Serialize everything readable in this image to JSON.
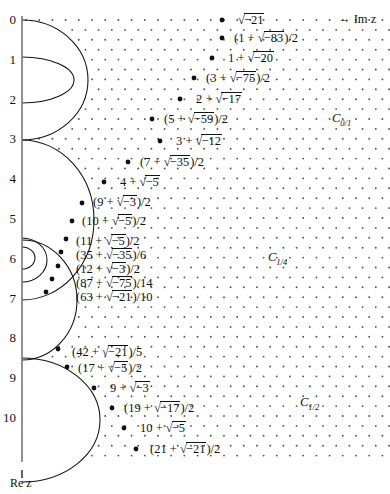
{
  "figure": {
    "title_axis_real": "Re z",
    "axis_imag_label": "→ Im z",
    "real_axis_ticks": [
      "0",
      "1",
      "2",
      "3",
      "4",
      "5",
      "6",
      "7",
      "8",
      "9",
      "10"
    ],
    "colors": {
      "ink": "#111111",
      "lattice_dot": "#555555",
      "axis": "#777777"
    }
  },
  "region_labels": [
    {
      "name": "C-0-1",
      "text": "C",
      "sub": "0/1",
      "x": 332,
      "y": 111
    },
    {
      "name": "C-1-4",
      "text": "C",
      "sub": "1/4",
      "x": 268,
      "y": 250
    },
    {
      "name": "C-1-2",
      "text": "C",
      "sub": "1/2",
      "x": 300,
      "y": 395
    }
  ],
  "points": [
    {
      "label": "√−21",
      "dot_x": 222,
      "dot_y": 20,
      "label_x": 238,
      "label_y": 13
    },
    {
      "label": "(1 + √−83)/2",
      "dot_x": 222,
      "dot_y": 38,
      "label_x": 234,
      "label_y": 31
    },
    {
      "label": "1 + √−20",
      "dot_x": 212,
      "dot_y": 58,
      "label_x": 228,
      "label_y": 51
    },
    {
      "label": "(3 + √−75)/2",
      "dot_x": 194,
      "dot_y": 78,
      "label_x": 206,
      "label_y": 71
    },
    {
      "label": "2 + √−17",
      "dot_x": 180,
      "dot_y": 99,
      "label_x": 196,
      "label_y": 92
    },
    {
      "label": "(5 + √−59)/2",
      "dot_x": 152,
      "dot_y": 119,
      "label_x": 164,
      "label_y": 112
    },
    {
      "label": "3 + √−12",
      "dot_x": 160,
      "dot_y": 141,
      "label_x": 176,
      "label_y": 134
    },
    {
      "label": "(7 + √−35)/2",
      "dot_x": 128,
      "dot_y": 162,
      "label_x": 140,
      "label_y": 155
    },
    {
      "label": "4 + √−5",
      "dot_x": 104,
      "dot_y": 182,
      "label_x": 120,
      "label_y": 175
    },
    {
      "label": "(9 + √−3)/2",
      "dot_x": 82,
      "dot_y": 203,
      "label_x": 93,
      "label_y": 195
    },
    {
      "label": "(10 + √−5)/2",
      "dot_x": 72,
      "dot_y": 221,
      "label_x": 82,
      "label_y": 214
    },
    {
      "label": "(11 + √−5)/2",
      "dot_x": 66,
      "dot_y": 239,
      "label_x": 76,
      "label_y": 234
    },
    {
      "label": "(35 + √−35)/6",
      "dot_x": 61,
      "dot_y": 252,
      "label_x": 76,
      "label_y": 248
    },
    {
      "label": "(12 + √−3)/2",
      "dot_x": 58,
      "dot_y": 266,
      "label_x": 76,
      "label_y": 262
    },
    {
      "label": "(87 + √−75)/14",
      "dot_x": 52,
      "dot_y": 279,
      "label_x": 76,
      "label_y": 276
    },
    {
      "label": "(63 + √−21)/10",
      "dot_x": 46,
      "dot_y": 292,
      "label_x": 76,
      "label_y": 290
    },
    {
      "label": "(42 + √−21)/5",
      "dot_x": 58,
      "dot_y": 349,
      "label_x": 72,
      "label_y": 345
    },
    {
      "label": "(17 + √−5)/2",
      "dot_x": 67,
      "dot_y": 367,
      "label_x": 78,
      "label_y": 361
    },
    {
      "label": "9 + √−3",
      "dot_x": 94,
      "dot_y": 388,
      "label_x": 110,
      "label_y": 381
    },
    {
      "label": "(19 + √−17)/2",
      "dot_x": 112,
      "dot_y": 408,
      "label_x": 124,
      "label_y": 401
    },
    {
      "label": "10 + √−5",
      "dot_x": 124,
      "dot_y": 428,
      "label_x": 140,
      "label_y": 421
    },
    {
      "label": "(21 + √−21)/2",
      "dot_x": 136,
      "dot_y": 449,
      "label_x": 150,
      "label_y": 442
    }
  ],
  "lattice": {
    "description": "triangular lattice of small dots filling the region right of the boundary arcs",
    "dx": 13.2,
    "dy": 9.9,
    "x_start": 26,
    "y_start": 20,
    "x_end": 390,
    "y_end": 462,
    "dot_radius": 0.95
  },
  "boundary_arcs": [
    {
      "name": "arc-0-3",
      "cx": 22,
      "cy": 80,
      "rx": 66,
      "ry": 60
    },
    {
      "name": "arc-1-2",
      "cx": 22,
      "cy": 80,
      "rx": 52,
      "ry": 23
    },
    {
      "name": "arc-3-6",
      "cx": 22,
      "cy": 220,
      "rx": 72,
      "ry": 80
    },
    {
      "name": "arc-6-7",
      "cx": 22,
      "cy": 260,
      "rx": 25,
      "ry": 22
    },
    {
      "name": "arc-6b",
      "cx": 22,
      "cy": 258,
      "rx": 13,
      "ry": 11
    },
    {
      "name": "arc-7-9",
      "cx": 22,
      "cy": 300,
      "rx": 55,
      "ry": 60
    },
    {
      "name": "arc-9-11",
      "cx": 22,
      "cy": 420,
      "rx": 78,
      "ry": 62
    }
  ],
  "axis": {
    "x": 22,
    "y_top": 16,
    "y_bottom": 462,
    "tick_spacing": 39.8,
    "tick0_y": 20
  }
}
